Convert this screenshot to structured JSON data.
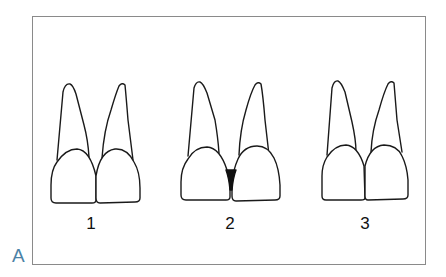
{
  "figure": {
    "panel_label": "A",
    "panel_label_color": "#4b82a6",
    "frame_color": "#8a8a8a",
    "groups": [
      {
        "id": 1,
        "label": "1",
        "description": "Two incisors with tight contact, no gap"
      },
      {
        "id": 2,
        "label": "2",
        "description": "Two incisors with open interdental gap (black triangle)"
      },
      {
        "id": 3,
        "label": "3",
        "description": "Two incisors with squared crowns and long contact"
      }
    ]
  }
}
